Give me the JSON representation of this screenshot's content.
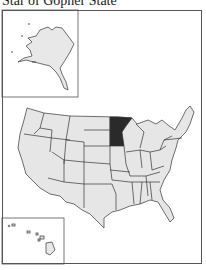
{
  "title": "Star of Gopher State",
  "map": {
    "highlighted_state": "Minnesota",
    "highlight_color": "#2a2a2a",
    "state_fill": "#e6e6e6",
    "border_color": "#333333",
    "insets": [
      "Alaska",
      "Hawaii"
    ]
  }
}
